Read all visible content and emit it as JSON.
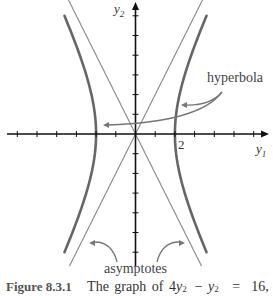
{
  "figure": {
    "number": "Figure 8.3.1",
    "caption_text": "The graph of 4y",
    "caption_eq": {
      "coef": "4",
      "var1": "y",
      "sub1": "1",
      "exp1": "2",
      "minus": "−",
      "var2": "y",
      "sub2": "2",
      "exp2": "2",
      "equals": "=",
      "rhs": "16,"
    },
    "labels": {
      "x_axis": "y1",
      "x_axis_var": "y",
      "x_axis_sub": "1",
      "y_axis_var": "y",
      "y_axis_sub": "2",
      "tick_label_2": "2",
      "hyperbola": "hyperbola",
      "asymptotes": "asymptotes"
    }
  },
  "chart_data": {
    "type": "line",
    "xlabel": "y1",
    "ylabel": "y2",
    "xlim": [
      -6.5,
      6.7
    ],
    "ylim": [
      -6.7,
      6.8
    ],
    "x_ticks": [
      -6,
      -5,
      -4,
      -3,
      -2,
      -1,
      1,
      2,
      3,
      4,
      5,
      6
    ],
    "y_ticks": [
      -6,
      -5,
      -4,
      -3,
      -2,
      -1,
      1,
      2,
      3,
      4,
      5,
      6
    ],
    "labeled_ticks": {
      "x": [
        2
      ]
    },
    "grid": false,
    "series": [
      {
        "name": "hyperbola (right branch)",
        "equation": "4y1^2 - y2^2 = 16",
        "y2_range": [
          -6,
          6
        ],
        "vertex": [
          2,
          0
        ]
      },
      {
        "name": "hyperbola (left branch)",
        "equation": "4y1^2 - y2^2 = 16",
        "y2_range": [
          -6,
          6
        ],
        "vertex": [
          -2,
          0
        ]
      },
      {
        "name": "asymptote",
        "equation": "y2 = 2y1"
      },
      {
        "name": "asymptote",
        "equation": "y2 = -2y1"
      }
    ],
    "annotations": [
      {
        "text": "hyperbola",
        "arrows_to": [
          "right branch",
          "left branch"
        ]
      },
      {
        "text": "asymptotes",
        "arrows_to": [
          "y2 = -2y1",
          "y2 = 2y1"
        ]
      }
    ],
    "colors": {
      "hyperbola": "#666666",
      "asymptote": "#8a8a8a",
      "axes": "#111111",
      "annotation_arrow": "#777777"
    }
  }
}
